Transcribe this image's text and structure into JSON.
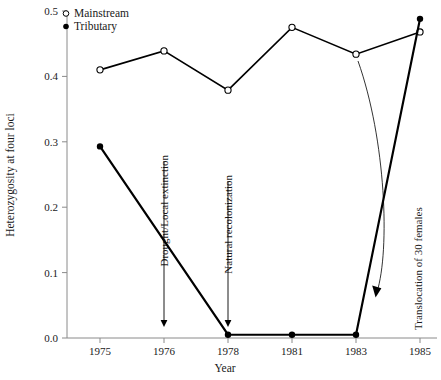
{
  "chart_data": {
    "type": "line",
    "title": "",
    "xlabel": "Year",
    "ylabel": "Heterozygosity at four loci",
    "categories": [
      "1975",
      "1976",
      "1978",
      "1981",
      "1983",
      "1985"
    ],
    "ylim": [
      0.0,
      0.5
    ],
    "yticks": [
      "0.0",
      "0.1",
      "0.2",
      "0.3",
      "0.4",
      "0.5"
    ],
    "ytick_values": [
      0.0,
      0.1,
      0.2,
      0.3,
      0.4,
      0.5
    ],
    "grid": false,
    "legend_position": "top-left",
    "series": [
      {
        "name": "Mainstream",
        "marker": "open-circle",
        "values": [
          0.41,
          0.439,
          0.379,
          0.475,
          0.434,
          0.468
        ]
      },
      {
        "name": "Tributary",
        "marker": "filled-circle",
        "values": [
          0.293,
          null,
          0.005,
          0.005,
          0.005,
          0.488
        ]
      }
    ],
    "annotations": [
      {
        "label": "Drought/Local extinction",
        "at_category": "1976",
        "arrow": "down"
      },
      {
        "label": "Natural recolonization",
        "at_category": "1978",
        "arrow": "down"
      },
      {
        "label": "Translocation of 30 females",
        "at_category": "1985",
        "arrow": "curved-down-left"
      }
    ]
  },
  "legend": {
    "items": [
      {
        "label": "Mainstream",
        "marker": "open-circle"
      },
      {
        "label": "Tributary",
        "marker": "filled-circle"
      }
    ]
  },
  "colors": {
    "line": "#000000",
    "axis": "#8a8a8a",
    "text": "#1a1a1a",
    "background": "#ffffff"
  }
}
